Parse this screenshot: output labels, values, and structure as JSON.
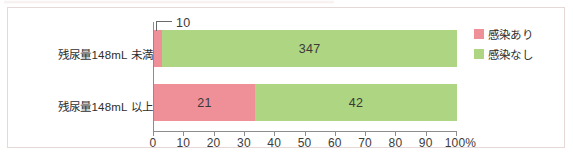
{
  "figure": {
    "frame_border_color": "#e7d8d8",
    "background": "#ffffff"
  },
  "legend": {
    "position": "right-top",
    "items": [
      {
        "label": "感染あり",
        "color": "#ef9099"
      },
      {
        "label": "感染なし",
        "color": "#aed581"
      }
    ]
  },
  "axis": {
    "ticks": [
      "0",
      "10",
      "20",
      "30",
      "40",
      "50",
      "60",
      "70",
      "80",
      "90",
      "100%"
    ],
    "tick_values": [
      0,
      10,
      20,
      30,
      40,
      50,
      60,
      70,
      80,
      90,
      100
    ]
  },
  "annotation": {
    "callout_value": "10"
  },
  "chart_data": {
    "type": "bar",
    "orientation": "horizontal",
    "stacked": true,
    "normalized": true,
    "title": "",
    "xlabel": "",
    "ylabel": "",
    "xlim": [
      0,
      100
    ],
    "grid": false,
    "legend_position": "right-top",
    "categories": [
      "残尿量148mL 未満",
      "残尿量148mL 以上"
    ],
    "series": [
      {
        "name": "感染あり",
        "color": "#ef9099",
        "values": [
          10,
          21
        ],
        "percents": [
          2.8,
          33.3
        ],
        "labels": [
          "10",
          "21"
        ],
        "label_placement": [
          "callout",
          "inside"
        ]
      },
      {
        "name": "感染なし",
        "color": "#aed581",
        "values": [
          347,
          42
        ],
        "percents": [
          97.2,
          66.7
        ],
        "labels": [
          "347",
          "42"
        ],
        "label_placement": [
          "inside",
          "inside"
        ]
      }
    ],
    "totals": [
      357,
      63
    ],
    "tick_labels": [
      "0",
      "10",
      "20",
      "30",
      "40",
      "50",
      "60",
      "70",
      "80",
      "90",
      "100%"
    ]
  }
}
